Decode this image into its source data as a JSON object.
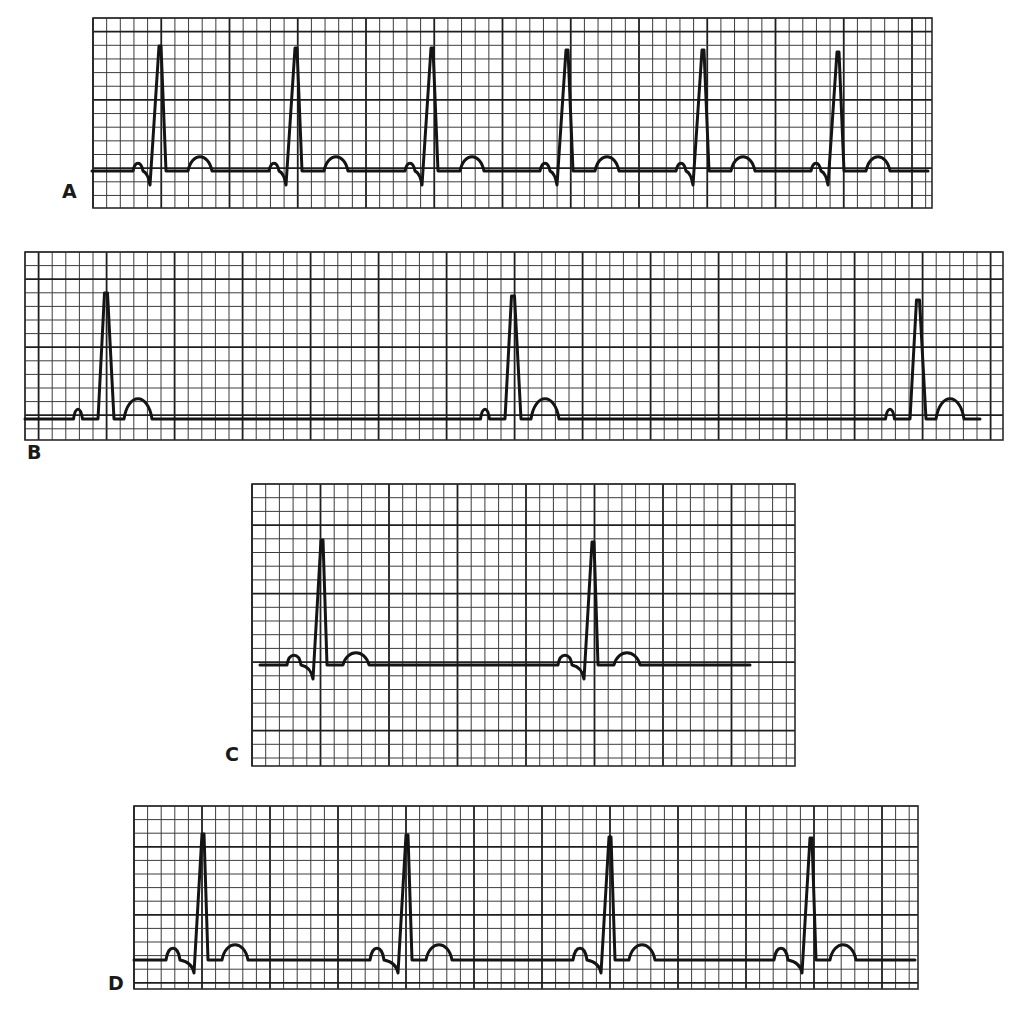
{
  "figure": {
    "colors": {
      "background": "#ffffff",
      "grid": "#3c3c3c",
      "grid_major": "#1e1e1e",
      "trace": "#141414"
    }
  },
  "strips": [
    {
      "label": "A",
      "label_pos": [
        62,
        182
      ],
      "grid": {
        "x": 93,
        "y": 18,
        "width": 839,
        "height": 190,
        "small": 13.65,
        "major_offset_x": 0,
        "major_offset_y": 13.6
      },
      "baseline_y": 171,
      "beats": [
        {
          "r_x": 160,
          "r_y": 46
        },
        {
          "r_x": 296,
          "r_y": 48
        },
        {
          "r_x": 432,
          "r_y": 48
        },
        {
          "r_x": 567,
          "r_y": 50
        },
        {
          "r_x": 703,
          "r_y": 50
        },
        {
          "r_x": 838,
          "r_y": 52
        }
      ],
      "morph": {
        "p_dx": -22,
        "p_h": 8,
        "p_w": 10,
        "q_dx": -11,
        "s_dx": -10,
        "s_depth": 14,
        "t_dx": 40,
        "t_h": 14,
        "t_w": 24,
        "qrs_end_dx": 6
      },
      "trace_start": 92,
      "trace_end": 928
    },
    {
      "label": "B",
      "label_pos": [
        27,
        443
      ],
      "grid": {
        "x": 25,
        "y": 252,
        "width": 978,
        "height": 188,
        "small": 13.6,
        "major_offset_x": 13.6,
        "major_offset_y": 27.2
      },
      "baseline_y": 419,
      "beats": [
        {
          "r_x": 106,
          "r_y": 293
        },
        {
          "r_x": 513,
          "r_y": 296
        },
        {
          "r_x": 918,
          "r_y": 300
        }
      ],
      "morph": {
        "p_dx": -28,
        "p_h": 10,
        "p_w": 9,
        "q_dx": -8,
        "s_dx": 0,
        "s_depth": 0,
        "t_dx": 32,
        "t_h": 20,
        "t_w": 28,
        "qrs_end_dx": 8
      },
      "trace_start": 25,
      "trace_end": 980
    },
    {
      "label": "C",
      "label_pos": [
        225,
        745
      ],
      "grid": {
        "x": 252,
        "y": 484,
        "width": 543,
        "height": 282,
        "small": 13.7,
        "major_offset_x": 68.5,
        "major_offset_y": 41.1
      },
      "baseline_y": 665,
      "beats": [
        {
          "r_x": 322,
          "r_y": 540
        },
        {
          "r_x": 593,
          "r_y": 542
        }
      ],
      "morph": {
        "p_dx": -28,
        "p_h": 10,
        "p_w": 14,
        "q_dx": -10,
        "s_dx": -9,
        "s_depth": 14,
        "t_dx": 34,
        "t_h": 12,
        "t_w": 26,
        "qrs_end_dx": 5
      },
      "trace_start": 260,
      "trace_end": 750
    },
    {
      "label": "D",
      "label_pos": [
        108,
        974
      ],
      "grid": {
        "x": 134,
        "y": 806,
        "width": 784,
        "height": 183,
        "small": 13.6,
        "major_offset_x": 68,
        "major_offset_y": 43
      },
      "baseline_y": 960,
      "beats": [
        {
          "r_x": 203,
          "r_y": 834
        },
        {
          "r_x": 407,
          "r_y": 835
        },
        {
          "r_x": 610,
          "r_y": 837
        },
        {
          "r_x": 811,
          "r_y": 838
        }
      ],
      "morph": {
        "p_dx": -30,
        "p_h": 12,
        "p_w": 14,
        "q_dx": -8,
        "s_dx": -9,
        "s_depth": 13,
        "t_dx": 32,
        "t_h": 15,
        "t_w": 26,
        "qrs_end_dx": 5
      },
      "trace_start": 134,
      "trace_end": 915
    }
  ]
}
